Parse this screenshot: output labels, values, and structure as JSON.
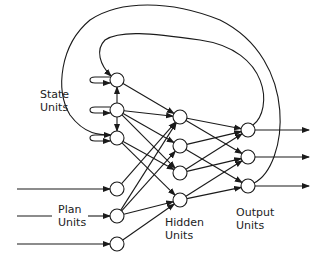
{
  "diagram": {
    "type": "recurrent-neural-network (Jordan network)",
    "colors": {
      "stroke": "#1a1a1a",
      "background": "#ffffff",
      "text": "#222222"
    },
    "node_radius": 7,
    "labels": {
      "state": [
        "State",
        "Units"
      ],
      "plan": [
        "Plan",
        "Units"
      ],
      "hidden": [
        "Hidden",
        "Units"
      ],
      "output": [
        "Output",
        "Units"
      ]
    },
    "layers": {
      "state": [
        {
          "x": 117,
          "y": 80
        },
        {
          "x": 117,
          "y": 110
        },
        {
          "x": 117,
          "y": 138
        }
      ],
      "plan": [
        {
          "x": 117,
          "y": 189
        },
        {
          "x": 117,
          "y": 216
        },
        {
          "x": 117,
          "y": 244
        }
      ],
      "hidden": [
        {
          "x": 180,
          "y": 117
        },
        {
          "x": 180,
          "y": 146
        },
        {
          "x": 180,
          "y": 173
        },
        {
          "x": 180,
          "y": 200
        }
      ],
      "output": [
        {
          "x": 248,
          "y": 130
        },
        {
          "x": 248,
          "y": 157
        },
        {
          "x": 248,
          "y": 186
        }
      ]
    },
    "connections": {
      "state_to_hidden": [
        [
          0,
          0
        ],
        [
          1,
          0
        ],
        [
          1,
          1
        ],
        [
          1,
          2
        ],
        [
          2,
          2
        ],
        [
          2,
          3
        ]
      ],
      "plan_to_hidden": [
        [
          0,
          0
        ],
        [
          1,
          0
        ],
        [
          1,
          1
        ],
        [
          1,
          3
        ],
        [
          2,
          3
        ]
      ],
      "hidden_to_output": [
        [
          0,
          0
        ],
        [
          0,
          1
        ],
        [
          1,
          0
        ],
        [
          1,
          2
        ],
        [
          2,
          0
        ],
        [
          2,
          1
        ],
        [
          3,
          1
        ],
        [
          3,
          2
        ]
      ],
      "state_lateral": [
        [
          1,
          0
        ],
        [
          1,
          2
        ]
      ],
      "state_self_loops": [
        0,
        1,
        2
      ],
      "output_to_state_feedback": [
        [
          0,
          0
        ],
        [
          2,
          2
        ]
      ],
      "plan_inputs": [
        0,
        1,
        2
      ],
      "output_arrows": [
        0,
        1,
        2
      ]
    }
  }
}
